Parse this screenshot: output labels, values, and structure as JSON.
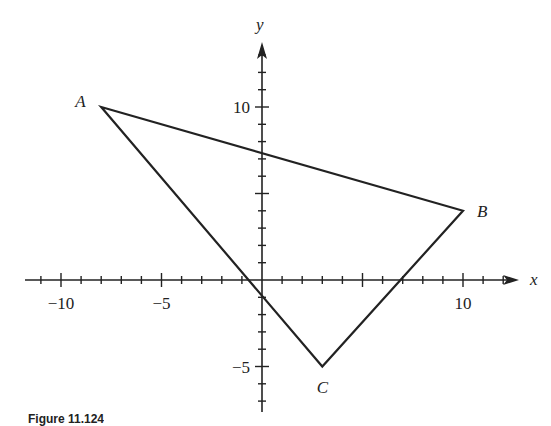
{
  "figure": {
    "caption": "Figure 11.124"
  },
  "chart_data": {
    "type": "scatter",
    "title": "",
    "xlabel": "x",
    "ylabel": "y",
    "xlim": [
      -11,
      12
    ],
    "ylim": [
      -7,
      13
    ],
    "x_tick_step": 1,
    "y_tick_step": 1,
    "x_tick_labels": [
      {
        "value": -10,
        "label": "−10"
      },
      {
        "value": -5,
        "label": "−5"
      },
      {
        "value": 10,
        "label": "10"
      }
    ],
    "y_tick_labels": [
      {
        "value": 10,
        "label": "10"
      },
      {
        "value": -5,
        "label": "−5"
      }
    ],
    "grid": false,
    "points": [
      {
        "name": "A",
        "x": -8,
        "y": 10
      },
      {
        "name": "B",
        "x": 10,
        "y": 4
      },
      {
        "name": "C",
        "x": 3,
        "y": -5
      }
    ],
    "polygon": [
      "A",
      "B",
      "C"
    ]
  },
  "style": {
    "line_color": "#222222",
    "background": "#ffffff"
  }
}
